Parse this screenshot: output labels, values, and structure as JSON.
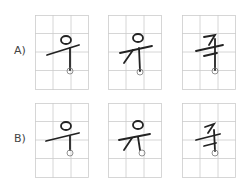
{
  "rows": [
    {
      "label": "A)",
      "y": 15
    },
    {
      "label": "B)",
      "y": 103
    }
  ],
  "boxes_x": [
    35,
    108,
    182
  ],
  "colors": {
    "grid": "#cccccc",
    "stroke": "#222222",
    "marker": "#777777"
  }
}
